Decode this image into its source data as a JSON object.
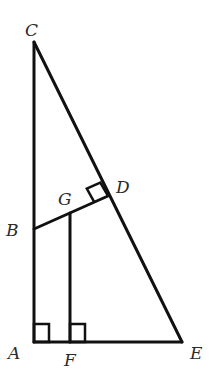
{
  "figure": {
    "type": "geometry-diagram",
    "points": {
      "A": {
        "label": "A",
        "x": 34,
        "y": 342
      },
      "B": {
        "label": "B",
        "x": 34,
        "y": 229
      },
      "C": {
        "label": "C",
        "x": 34,
        "y": 42
      },
      "D": {
        "label": "D",
        "x": 108,
        "y": 196
      },
      "E": {
        "label": "E",
        "x": 182,
        "y": 342
      },
      "F": {
        "label": "F",
        "x": 70,
        "y": 342
      },
      "G": {
        "label": "G",
        "x": 70,
        "y": 213
      }
    },
    "segments": [
      "CA",
      "AE",
      "CE",
      "BD",
      "GF"
    ],
    "right_angles": [
      "A",
      "F",
      "D"
    ],
    "labels": {
      "A": "A",
      "B": "B",
      "C": "C",
      "D": "D",
      "E": "E",
      "F": "F",
      "G": "G"
    },
    "stroke_color": "#111111",
    "label_color": "#2a2a2a"
  }
}
